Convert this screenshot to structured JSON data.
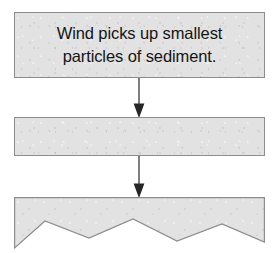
{
  "diagram": {
    "title": "Wind Erosion",
    "title_clipped": true,
    "colors": {
      "panel_fill": "#e2e2e2",
      "panel_border": "#8d8d8d",
      "text": "#151515",
      "arrow": "#333333",
      "background": "#ffffff"
    },
    "stages": [
      {
        "id": "stage-1",
        "kind": "text-box",
        "lines": [
          "Wind picks up smallest",
          "particles of sediment."
        ],
        "text": "Wind picks up smallest particles of sediment."
      },
      {
        "id": "stage-2",
        "kind": "sediment-bar-flat",
        "lines": [],
        "text": ""
      },
      {
        "id": "stage-3",
        "kind": "sediment-bar-eroded",
        "lines": [],
        "text": "",
        "zigzag_peaks": 3,
        "zigzag_valleys": 2
      }
    ],
    "connectors": [
      {
        "id": "connector-1",
        "direction": "down",
        "from": "stage-1",
        "to": "stage-2"
      },
      {
        "id": "connector-2",
        "direction": "down",
        "from": "stage-2",
        "to": "stage-3"
      }
    ]
  }
}
